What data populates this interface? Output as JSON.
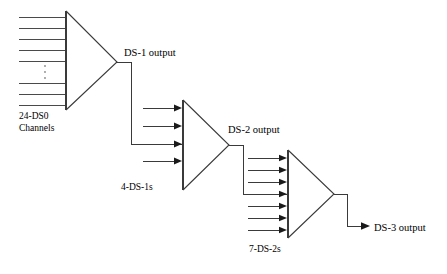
{
  "figure": {
    "background_color": "#ffffff",
    "line_color": "#3a3a3a",
    "text_color": "#000000",
    "ellipsis_color": "#8a8a8a"
  },
  "labels": {
    "input_channels_line1": "24-DS0",
    "input_channels_line2": "Channels",
    "ds1_output": "DS-1 output",
    "ds1_inputs": "4-DS-1s",
    "ds2_output": "DS-2 output",
    "ds2_inputs": "7-DS-2s",
    "ds3_output": "DS-3 output"
  },
  "stages": [
    {
      "id": "mux-1",
      "name": "DS0 to DS-1 multiplexer",
      "input_count": 24,
      "input_label": "24-DS0 Channels",
      "output_label": "DS-1 output",
      "input_style": "plain-line",
      "has_ellipsis": true,
      "drawn_input_lines_top": 5,
      "drawn_input_lines_bottom": 3,
      "geometry": {
        "face_x": 66,
        "top_y": 11,
        "bottom_y": 110,
        "apex_x": 117,
        "apex_y": 62
      },
      "line_ys_top": [
        17,
        28,
        39,
        50,
        61
      ],
      "line_ys_bottom": [
        83,
        94,
        105
      ],
      "line_start_x": 19
    },
    {
      "id": "mux-2",
      "name": "DS-1 to DS-2 multiplexer",
      "input_count": 4,
      "input_label": "4-DS-1s",
      "output_label": "DS-2 output",
      "input_style": "arrow",
      "has_ellipsis": false,
      "geometry": {
        "face_x": 183,
        "top_y": 100,
        "bottom_y": 190,
        "apex_x": 229,
        "apex_y": 145
      },
      "arrow_ys": [
        108,
        126,
        144,
        161
      ],
      "arrow_start_x": 143,
      "fed_arrow_index": 2
    },
    {
      "id": "mux-3",
      "name": "DS-2 to DS-3 multiplexer",
      "input_count": 7,
      "input_label": "7-DS-2s",
      "output_label": "DS-3 output",
      "input_style": "arrow",
      "has_ellipsis": false,
      "geometry": {
        "face_x": 288,
        "top_y": 150,
        "bottom_y": 238,
        "apex_x": 334,
        "apex_y": 194
      },
      "arrow_ys": [
        158,
        170,
        182,
        194,
        206,
        218,
        230
      ],
      "arrow_start_x": 248,
      "fed_arrow_index": 3
    }
  ],
  "connections": [
    {
      "id": "ds1-to-mux2",
      "from": "mux-1 apex",
      "to": "mux-2 input 3",
      "path": "M117,62 L131,62 L131,144 L183,144",
      "label": "DS-1 output"
    },
    {
      "id": "ds2-to-mux3",
      "from": "mux-2 apex",
      "to": "mux-3 input 4",
      "path": "M229,145 L243,145 L243,194 L288,194",
      "label": "DS-2 output"
    },
    {
      "id": "ds3-out",
      "from": "mux-3 apex",
      "to": "DS-3 output label",
      "path": "M334,194 L347,194 L347,226 L368,226",
      "label": "DS-3 output",
      "terminated_with_arrow": true
    }
  ],
  "label_positions": {
    "input_channels_line1": {
      "x": 19,
      "y": 119
    },
    "input_channels_line2": {
      "x": 19,
      "y": 131
    },
    "ds1_output": {
      "x": 124,
      "y": 56
    },
    "ds1_inputs": {
      "x": 121,
      "y": 190
    },
    "ds2_output": {
      "x": 228,
      "y": 133
    },
    "ds2_inputs": {
      "x": 249,
      "y": 252
    },
    "ds3_output": {
      "x": 374,
      "y": 231
    }
  },
  "ellipsis": {
    "x": 45,
    "dot_ys": [
      66,
      72,
      78
    ],
    "radius": 0.9
  }
}
